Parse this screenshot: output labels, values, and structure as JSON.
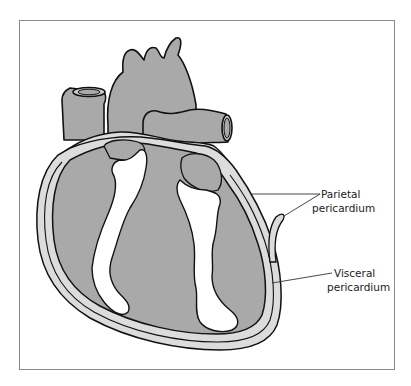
{
  "figure": {
    "colors": {
      "heart_fill": "#a9a9a9",
      "pericardium_band": "#dcdcdc",
      "chamber_cavity": "#ffffff",
      "outline": "#111111",
      "frame": "#8a8a8a"
    }
  },
  "labels": {
    "parietal": {
      "line1": "Parietal",
      "line2": "pericardium"
    },
    "visceral": {
      "line1": "Visceral",
      "line2": "pericardium"
    }
  }
}
